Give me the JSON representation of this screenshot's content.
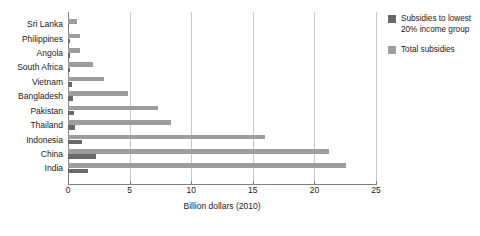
{
  "chart_data": {
    "type": "bar",
    "orientation": "horizontal",
    "title": "",
    "subtitle": "",
    "xlabel": "Billion dollars (2010)",
    "ylabel": "",
    "xlim": [
      0,
      25
    ],
    "xticks": [
      "0",
      "5",
      "10",
      "15",
      "20",
      "25"
    ],
    "grid": true,
    "legend_position": "right",
    "categories": [
      "Sri Lanka",
      "Philippines",
      "Angola",
      "South Africa",
      "Vietnam",
      "Bangladesh",
      "Pakistan",
      "Thailand",
      "Indonesia",
      "China",
      "India"
    ],
    "series": [
      {
        "name": "Subsidies to lowest 20% income group",
        "color": "#6a6a6a",
        "values": [
          0.1,
          0.15,
          0.15,
          0.2,
          0.3,
          0.4,
          0.5,
          0.55,
          1.1,
          2.3,
          1.6
        ]
      },
      {
        "name": "Total subsidies",
        "color": "#9d9d9d",
        "values": [
          0.7,
          1.0,
          1.0,
          2.0,
          2.9,
          4.9,
          7.3,
          8.4,
          16.0,
          21.2,
          22.6
        ]
      }
    ]
  },
  "legend": {
    "items": [
      {
        "label": "Subsidies to lowest 20% income group",
        "swatch": "sw-low"
      },
      {
        "label": "Total subsidies",
        "swatch": "sw-total"
      }
    ]
  }
}
